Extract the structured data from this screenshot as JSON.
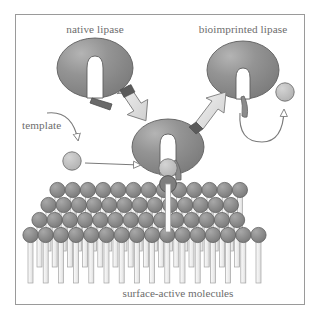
{
  "figure": {
    "title_alt": "Bioimprinting of lipase at a surface-active molecule monolayer",
    "frame": {
      "border_color": "#9a9a9a",
      "background": "#ffffff",
      "x": 15,
      "y": 14,
      "width": 290,
      "height": 291
    },
    "colors": {
      "protein_fill": "#8c8c8c",
      "protein_highlight": "#a9a9a9",
      "protein_outline": "#5f5f5f",
      "cleft_fill": "#ffffff",
      "lid_dark": "#6a6a6a",
      "template_fill": "#bdbdbd",
      "template_outline": "#6f6f6f",
      "headgroup_fill": "#8f8f8f",
      "headgroup_outline": "#5c5c5c",
      "tail_fill": "#f2f2f2",
      "tail_outline": "#9d9d9d",
      "block_arrow_fill": "#e2e2e2",
      "block_arrow_outline": "#7a7a7a",
      "block_arrow_band": "#5a5a5a",
      "thin_arrow": "#7b7b7b",
      "text": "#6d6d6d"
    },
    "labels": {
      "native_lipase": "native lipase",
      "bioimprinted_lipase": "bioimprinted lipase",
      "template": "template",
      "surface_active_molecules": "surface-active molecules"
    },
    "elements": {
      "native_lipase_blob": "native-lipase-protein",
      "bioimprinted_lipase_blob": "bioimprinted-lipase-protein",
      "docked_lipase_blob": "docked-lipase-protein",
      "free_template_circle": "free-template-molecule",
      "bound_template_circle": "bound-template-molecule",
      "released_template_circle": "released-template-molecule",
      "monolayer": "surface-active-monolayer"
    },
    "monolayer": {
      "rows": 6,
      "columns": 13,
      "head_radius": 7.6,
      "row_dx": -9.0,
      "row_dy": 15.0,
      "col_dx": 15.2,
      "origin_x": 57,
      "origin_y": 190,
      "tail_width": 5.0,
      "tail_length": 48
    },
    "arrows": {
      "block_arrow_left": "native-to-docked-arrow",
      "block_arrow_right": "docked-to-bioimprinted-arrow",
      "template_curve": "template-pointer-arrow",
      "template_entry": "template-entry-arrow",
      "release_curve": "template-release-arrow"
    }
  }
}
